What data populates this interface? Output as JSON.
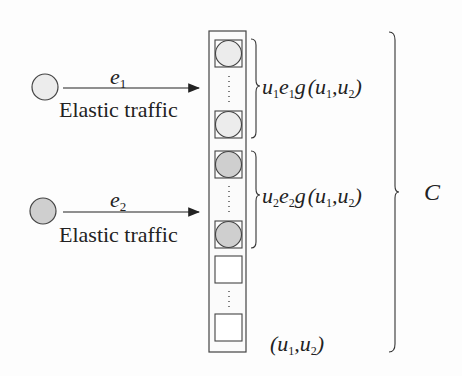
{
  "diagram": {
    "type": "elastic-traffic-link-model",
    "sources": [
      {
        "id": "flow-1",
        "fill": "#ececec",
        "rate_label": "e",
        "rate_sub": "1",
        "caption": "Elastic traffic"
      },
      {
        "id": "flow-2",
        "fill": "#cfcfcf",
        "rate_label": "e",
        "rate_sub": "2",
        "caption": "Elastic traffic"
      }
    ],
    "link": {
      "slots_group_1": {
        "fill": "#ececec",
        "count_visible": 2
      },
      "slots_group_2": {
        "fill": "#cfcfcf",
        "count_visible": 2
      },
      "slots_free": {
        "count_visible": 2
      }
    },
    "labels": {
      "group1": {
        "u": "u",
        "u_sub": "1",
        "e": "e",
        "e_sub": "1",
        "g": "g",
        "args": "(u",
        "a1": "1",
        "comma": ",u",
        "a2": "2",
        "close": ")"
      },
      "group2": {
        "u": "u",
        "u_sub": "2",
        "e": "e",
        "e_sub": "2",
        "g": "g",
        "args": "(u",
        "a1": "1",
        "comma": ",u",
        "a2": "2",
        "close": ")"
      },
      "state": {
        "open": "(u",
        "a1": "1",
        "comma": ",u",
        "a2": "2",
        "close": ")"
      },
      "capacity": "C"
    },
    "colors": {
      "stroke": "#333333",
      "light_fill": "#ececec",
      "dark_fill": "#cfcfcf"
    }
  }
}
